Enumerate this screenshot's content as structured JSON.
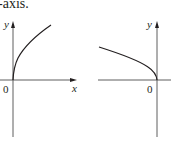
{
  "caption": "-axis.",
  "graphs": [
    {
      "id": "left",
      "y_label": "y",
      "x_label": "x",
      "origin_label": "0",
      "curve": "y = sqrt(x), increasing from origin into first quadrant"
    },
    {
      "id": "right",
      "y_label": "y",
      "origin_label": "0",
      "curve": "y = sqrt(-x), decreasing toward origin from second quadrant"
    }
  ],
  "colors": {
    "ink": "#231f20",
    "axis": "#4d4d4d"
  }
}
